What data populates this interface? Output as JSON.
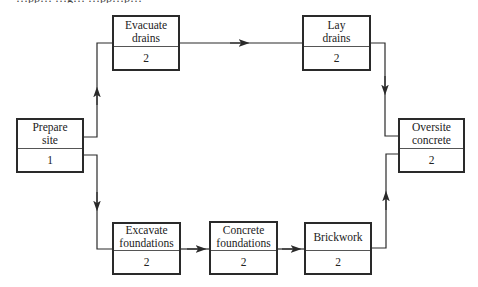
{
  "caption_fragment": "…pp…                    …g…                              …pp…p…",
  "diagram": {
    "type": "activity-on-node network",
    "nodes": [
      {
        "id": "prepare_site",
        "label": "Prepare\nsite",
        "duration": "1"
      },
      {
        "id": "evacuate_drains",
        "label": "Evacuate\ndrains",
        "duration": "2"
      },
      {
        "id": "lay_drains",
        "label": "Lay\ndrains",
        "duration": "2"
      },
      {
        "id": "excavate_foundations",
        "label": "Excavate\nfoundations",
        "duration": "2"
      },
      {
        "id": "concrete_foundations",
        "label": "Concrete\nfoundations",
        "duration": "2"
      },
      {
        "id": "brickwork",
        "label": "Brickwork",
        "duration": "2"
      },
      {
        "id": "oversite_concrete",
        "label": "Oversite\nconcrete",
        "duration": "2"
      }
    ],
    "edges": [
      {
        "from": "prepare_site",
        "to": "evacuate_drains"
      },
      {
        "from": "evacuate_drains",
        "to": "lay_drains"
      },
      {
        "from": "lay_drains",
        "to": "oversite_concrete"
      },
      {
        "from": "prepare_site",
        "to": "excavate_foundations"
      },
      {
        "from": "excavate_foundations",
        "to": "concrete_foundations"
      },
      {
        "from": "concrete_foundations",
        "to": "brickwork"
      },
      {
        "from": "brickwork",
        "to": "oversite_concrete"
      }
    ],
    "colors": {
      "line": "#2a2a2a",
      "background": "#ffffff"
    }
  }
}
